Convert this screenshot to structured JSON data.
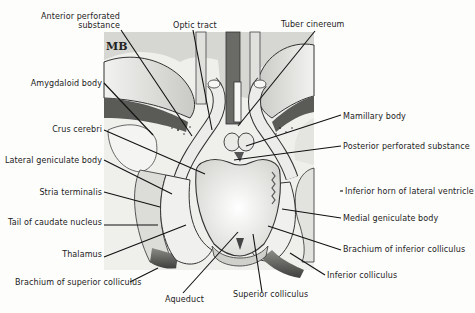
{
  "diagram": {
    "monogram": "MB",
    "colors": {
      "background": "#fdfdfc",
      "ink": "#222222",
      "tissue_light": "#e8e8e6",
      "tissue_mid": "#bdbdb9",
      "tissue_dark": "#4a4a48"
    },
    "labels": {
      "anterior_perforated_substance_1": "Anterior perforated",
      "anterior_perforated_substance_2": "substance",
      "optic_tract": "Optic tract",
      "tuber_cinereum": "Tuber cinereum",
      "amygdaloid_body": "Amygdaloid body",
      "mamillary_body": "Mamillary body",
      "crus_cerebri": "Crus cerebri",
      "posterior_perforated_substance": "Posterior perforated substance",
      "lateral_geniculate_body": "Lateral geniculate body",
      "stria_terminalis": "Stria terminalis",
      "inferior_horn_lateral_ventricle": "Inferior horn of lateral ventricle",
      "tail_caudate_nucleus": "Tail of caudate nucleus",
      "medial_geniculate_body": "Medial geniculate body",
      "thalamus": "Thalamus",
      "brachium_inferior_colliculus": "Brachium of inferior colliculus",
      "inferior_colliculus": "Inferior colliculus",
      "brachium_superior_colliculus": "Brachium of superior colliculus",
      "superior_colliculus": "Superior colliculus",
      "aqueduct": "Aqueduct"
    }
  }
}
